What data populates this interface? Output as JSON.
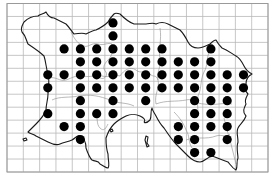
{
  "map": {
    "subject": "Island distribution map (grid squares with records)",
    "grid": {
      "left": 7,
      "top": 3.5,
      "right": 268,
      "bottom": 172,
      "columns": 16,
      "rows": 13,
      "line_color": "#b9b9b9"
    },
    "dot": {
      "radius": 4.6,
      "color": "#000000"
    },
    "occupied_squares": [
      {
        "row": 1,
        "cols": [
          6
        ]
      },
      {
        "row": 2,
        "cols": [
          6
        ]
      },
      {
        "row": 3,
        "cols": [
          3,
          4,
          5,
          6,
          7,
          8,
          9,
          12
        ]
      },
      {
        "row": 4,
        "cols": [
          4,
          5,
          6,
          7,
          8,
          9,
          10,
          11,
          12
        ]
      },
      {
        "row": 5,
        "cols": [
          2,
          3,
          4,
          5,
          6,
          7,
          8,
          9,
          10,
          11,
          12,
          13,
          14
        ]
      },
      {
        "row": 6,
        "cols": [
          2,
          4,
          5,
          6,
          7,
          8,
          9,
          10,
          11,
          12,
          13,
          14
        ]
      },
      {
        "row": 7,
        "cols": [
          4,
          6,
          8,
          11,
          12,
          13
        ]
      },
      {
        "row": 8,
        "cols": [
          2,
          4,
          5,
          6,
          11,
          12,
          13
        ]
      },
      {
        "row": 9,
        "cols": [
          3,
          4,
          10,
          11,
          12,
          13
        ]
      },
      {
        "row": 10,
        "cols": [
          4,
          10,
          11,
          13
        ]
      },
      {
        "row": 11,
        "cols": [
          11,
          12
        ]
      }
    ],
    "colors": {
      "coastline": "#1a1a1a",
      "parish_boundary": "#8c8c8c",
      "background": "#ffffff"
    }
  }
}
